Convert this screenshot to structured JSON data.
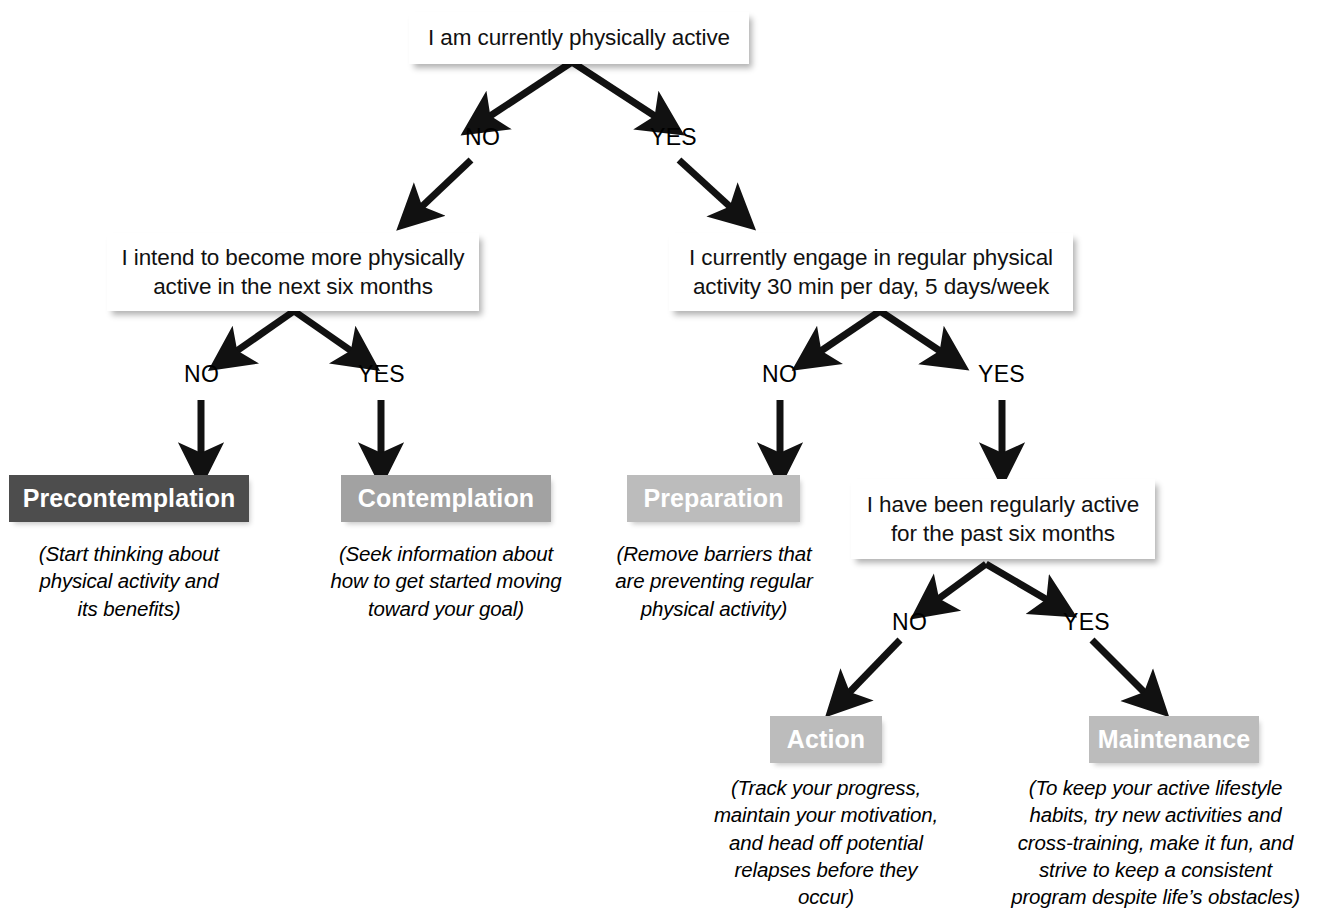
{
  "diagram": {
    "colors": {
      "background": "#ffffff",
      "arrow": "#111111",
      "box_white": "#ffffff",
      "precontemplation": "#4d4d4d",
      "contemplation": "#a2a2a2",
      "preparation": "#bcbcbc",
      "action": "#bcbcbc",
      "maintenance": "#bcbcbc",
      "text_dark": "#111111",
      "text_light": "#ffffff"
    },
    "questions": [
      {
        "id": "q-root",
        "text": "I am currently physically active"
      },
      {
        "id": "q-intend",
        "line1": "I intend to become more physically",
        "line2": "active in the next six months"
      },
      {
        "id": "q-regular",
        "line1": "I currently engage in regular physical",
        "line2": "activity 30 min per day, 5 days/week"
      },
      {
        "id": "q-six-months",
        "line1": "I have been regularly active",
        "line2": "for the past six months"
      }
    ],
    "edge_labels": {
      "root_no": "NO",
      "root_yes": "YES",
      "intend_no": "NO",
      "intend_yes": "YES",
      "regular_no": "NO",
      "regular_yes": "YES",
      "sixmonths_no": "NO",
      "sixmonths_yes": "YES"
    },
    "stages": [
      {
        "id": "precontemplation",
        "label": "Precontemplation",
        "caption": "(Start thinking about\nphysical activity and\nits benefits)"
      },
      {
        "id": "contemplation",
        "label": "Contemplation",
        "caption": "(Seek information about\nhow to get started moving\ntoward your goal)"
      },
      {
        "id": "preparation",
        "label": "Preparation",
        "caption": "(Remove barriers that\nare preventing regular\nphysical activity)"
      },
      {
        "id": "action",
        "label": "Action",
        "caption": "(Track your progress,\nmaintain your motivation,\nand head off potential\nrelapses before they occur)"
      },
      {
        "id": "maintenance",
        "label": "Maintenance",
        "caption": "(To keep your active lifestyle\nhabits, try new activities and\ncross-training, make it fun, and\nstrive to keep a consistent\nprogram despite life’s obstacles)"
      }
    ]
  }
}
